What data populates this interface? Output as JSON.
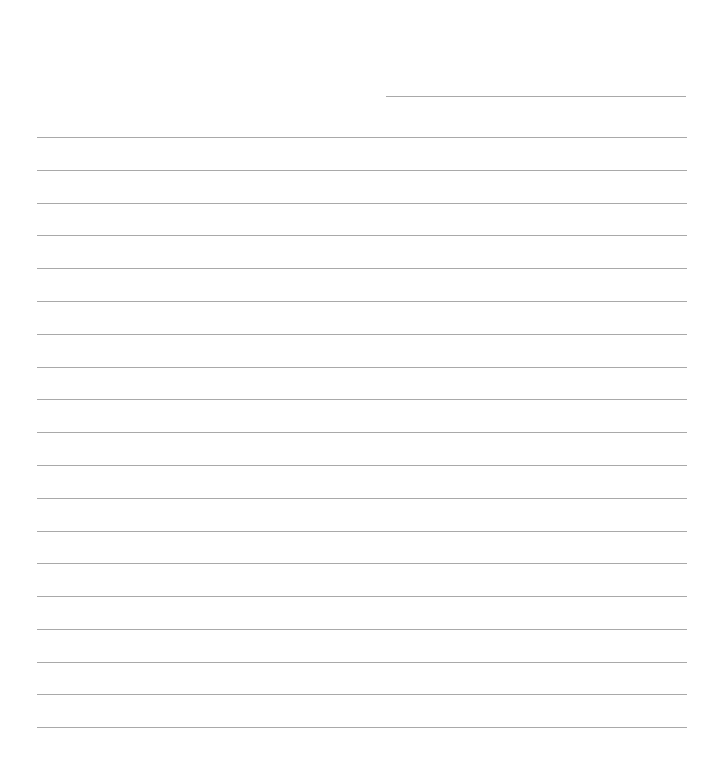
{
  "page": {
    "type": "blank lined paper",
    "background_color": "#ffffff",
    "line_color": "#a9a9a9",
    "header_line": {
      "x_start": 386,
      "x_end": 686,
      "y": 96
    },
    "ruled_lines": {
      "count": 19,
      "x_start": 37,
      "x_end": 687,
      "y_positions": [
        137,
        170,
        203,
        235,
        268,
        301,
        334,
        367,
        399,
        432,
        465,
        498,
        531,
        563,
        596,
        629,
        662,
        694,
        727
      ]
    }
  }
}
